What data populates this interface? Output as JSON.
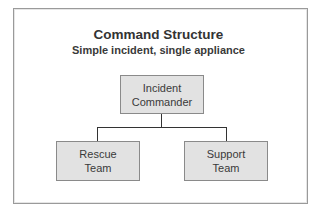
{
  "title": "Command Structure",
  "subtitle": "Simple incident, single appliance",
  "nodes": {
    "commander": {
      "line1": "Incident",
      "line2": "Commander"
    },
    "rescue": {
      "line1": "Rescue",
      "line2": "Team"
    },
    "support": {
      "line1": "Support",
      "line2": "Team"
    }
  },
  "colors": {
    "node_fill": "#e2e2e2",
    "node_border": "#8a8a8a",
    "connector": "#333333",
    "frame_border": "#9a9a9a"
  }
}
